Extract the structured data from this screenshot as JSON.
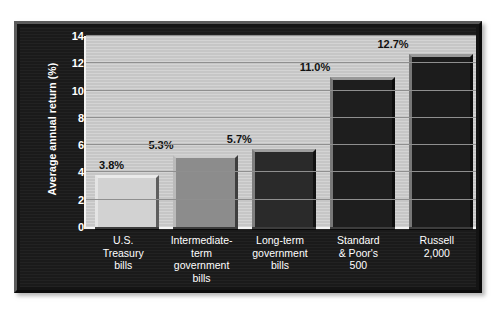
{
  "chart_data": {
    "type": "bar",
    "title": "",
    "subtitle": "",
    "xlabel": "",
    "ylabel": "Average annual return (%)",
    "ylim": [
      0,
      14
    ],
    "yticks": [
      14,
      12,
      10,
      8,
      6,
      4,
      2,
      0
    ],
    "grid": true,
    "legend": "none",
    "categories": [
      "U.S.\nTreasury\nbills",
      "Intermediate-\nterm\ngovernment\nbills",
      "Long-term\ngovernment\nbills",
      "Standard\n& Poor's\n500",
      "Russell\n2,000"
    ],
    "values": [
      3.8,
      5.7,
      5.7,
      11.0,
      12.7
    ],
    "bar_values": [
      3.8,
      5.3,
      5.7,
      11.0,
      12.7
    ],
    "data_labels": [
      "3.8%",
      "5.3%",
      "5.7%",
      "11.0%",
      "12.7%"
    ],
    "bar_colors": [
      "#d2d2d2",
      "#8c8c8c",
      "#2a2a2a",
      "#1e1e1e",
      "#1c1c1c"
    ]
  },
  "style": {
    "frame_color": "#161616",
    "plot_background": "#c6c6c6",
    "gridline_color": "#8f8f8f",
    "axis_text_color": "#ffffff",
    "label_text_color": "#111111",
    "page_background": "#ffffff"
  }
}
